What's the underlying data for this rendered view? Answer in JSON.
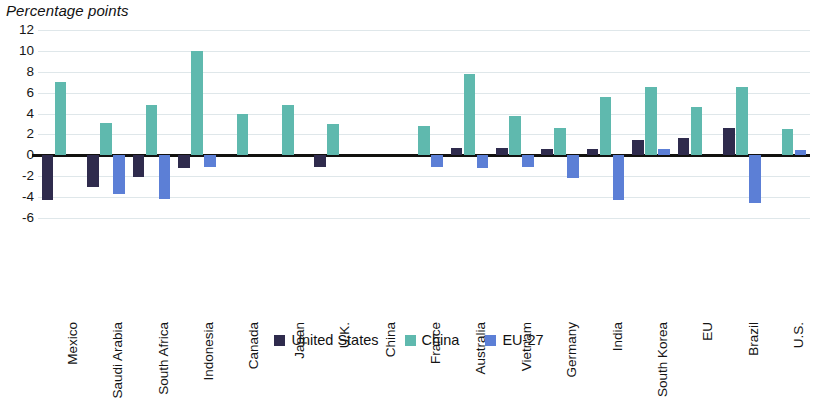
{
  "header": {
    "axis_title": "Percentage points"
  },
  "legend": {
    "position": "bottom-center",
    "items": [
      {
        "label": "United States",
        "color": "#2f2b4d",
        "key": "united_states"
      },
      {
        "label": "China",
        "color": "#5fb9ae",
        "key": "china"
      },
      {
        "label": "EU-27",
        "color": "#5c7fd6",
        "key": "eu_27"
      }
    ]
  },
  "chart_data": {
    "type": "bar",
    "title": "",
    "subtitle": "",
    "xlabel": "",
    "ylabel": "Percentage points",
    "ylim": [
      -6,
      12
    ],
    "ytick_step": 2,
    "yticks": [
      12,
      10,
      8,
      6,
      4,
      2,
      0,
      -2,
      -4,
      -6
    ],
    "ytick_labels": [
      "12",
      "10",
      "8",
      "6",
      "4",
      "2",
      "0",
      "-2",
      "-4",
      "-6"
    ],
    "grid": true,
    "grid_axis": "y",
    "zero_line": true,
    "orientation": "vertical",
    "grouping": "grouped",
    "categories": [
      "Mexico",
      "Saudi Arabia",
      "South Africa",
      "Indonesia",
      "Canada",
      "Japan",
      "U.K.",
      "China",
      "France",
      "Australia",
      "Vietnam",
      "Germany",
      "India",
      "South Korea",
      "EU",
      "Brazil",
      "U.S."
    ],
    "series": [
      {
        "name": "United States",
        "color": "#2f2b4d",
        "values": [
          -4.3,
          -3.0,
          -2.1,
          -1.2,
          0,
          0,
          -1.1,
          0,
          0,
          0.7,
          0.7,
          0.6,
          0.6,
          1.5,
          1.7,
          2.6,
          0
        ]
      },
      {
        "name": "China",
        "color": "#5fb9ae",
        "values": [
          7.0,
          3.1,
          4.8,
          10.0,
          4.0,
          4.8,
          3.0,
          0,
          2.8,
          7.8,
          3.8,
          2.6,
          5.6,
          6.5,
          4.6,
          6.5,
          2.5
        ]
      },
      {
        "name": "EU-27",
        "color": "#5c7fd6",
        "values": [
          0,
          -3.7,
          -4.2,
          -1.1,
          0,
          0,
          0,
          0,
          -1.1,
          -1.2,
          -1.1,
          -2.2,
          -4.3,
          0.6,
          0,
          -4.6,
          0.5
        ]
      }
    ]
  }
}
